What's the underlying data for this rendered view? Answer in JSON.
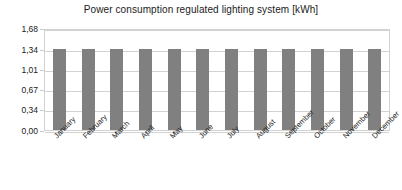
{
  "chart_data": {
    "type": "bar",
    "title": "Power consumption regulated lighting system [kWh]",
    "xlabel": "",
    "ylabel": "",
    "categories": [
      "January",
      "February",
      "March",
      "April",
      "May",
      "June",
      "July",
      "August",
      "September",
      "October",
      "November",
      "December"
    ],
    "values": [
      1.34,
      1.34,
      1.34,
      1.34,
      1.34,
      1.34,
      1.34,
      1.34,
      1.34,
      1.34,
      1.34,
      1.34
    ],
    "ylim": [
      0.0,
      1.68
    ],
    "ytick_values": [
      1.68,
      1.34,
      1.01,
      0.67,
      0.34,
      0.0
    ],
    "ytick_labels": [
      "1,68",
      "1,34",
      "1,01",
      "0,67",
      "0,34",
      "0,00"
    ],
    "grid": true,
    "legend": false,
    "legend_position": "none",
    "series": [
      {
        "name": "Power consumption",
        "color": "#808080",
        "values": [
          1.34,
          1.34,
          1.34,
          1.34,
          1.34,
          1.34,
          1.34,
          1.34,
          1.34,
          1.34,
          1.34,
          1.34
        ]
      }
    ]
  },
  "style": {
    "bar_color": "#808080",
    "gridline_color": "#d2d2d2",
    "plot_border_color": "#d2d2d2",
    "background_color": "#ffffff",
    "text_color": "#1a1a1a"
  }
}
